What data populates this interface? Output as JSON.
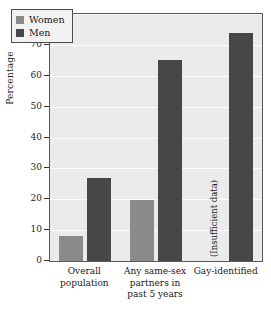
{
  "chart_data": {
    "type": "bar",
    "title": "",
    "xlabel": "",
    "ylabel": "Percentage",
    "ylim": [
      0,
      80
    ],
    "ytick_values": [
      0,
      10,
      20,
      30,
      40,
      50,
      60,
      70,
      80
    ],
    "ytick_labels": [
      "0",
      "10",
      "20",
      "30",
      "40",
      "50",
      "60",
      "70",
      "80"
    ],
    "grid": true,
    "grid_axis": "y",
    "legend_position": "upper left",
    "categories": [
      "Overall population",
      "Any same-sex partners in past 5 years",
      "Gay-identified"
    ],
    "category_label_lines": [
      [
        "Overall",
        "population"
      ],
      [
        "Any same-sex",
        "partners in",
        "past 5 years"
      ],
      [
        "Gay-identified"
      ]
    ],
    "series": [
      {
        "name": "Women",
        "color": "#8a8a8a",
        "values": [
          8,
          19.7,
          null
        ],
        "value_labels": [
          "8",
          "19.7",
          "(Insufficient data)"
        ]
      },
      {
        "name": "Men",
        "color": "#474747",
        "values": [
          27,
          65,
          74
        ],
        "value_labels": [
          "27",
          "65",
          "74"
        ]
      }
    ],
    "annotations": [
      {
        "text": "(Insufficient data)",
        "category": "Gay-identified",
        "series": "Women",
        "orientation": "vertical"
      }
    ]
  },
  "legend": {
    "items": [
      {
        "label": "Women",
        "color": "#8a8a8a"
      },
      {
        "label": "Men",
        "color": "#474747"
      }
    ]
  },
  "axes": {
    "y_title": "Percentage"
  },
  "colors": {
    "plot_background": "#ebebeb",
    "gridline": "#fbfbfb",
    "frame": "#5a5a5a",
    "women": "#8a8a8a",
    "men": "#474747",
    "text": "#1a1a1a"
  }
}
